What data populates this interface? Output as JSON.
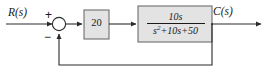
{
  "diagram": {
    "name": "closed-loop-feedback-control-block-diagram",
    "type": "control-system-block-diagram",
    "signals": {
      "input_label": "R(s)",
      "output_label": "C(s)"
    },
    "summing_junction": {
      "name": "summing-junction",
      "input_sign": "+",
      "feedback_sign": "−"
    },
    "blocks": [
      {
        "name": "gain-block",
        "label": "20",
        "kind": "gain"
      },
      {
        "name": "transfer-function-block",
        "kind": "transfer-function",
        "numerator": "10s",
        "denominator_base": "s",
        "denominator_exponent": "2",
        "denominator_rest": "+10s+50",
        "expression": "10s/(s^2+10s+50)"
      }
    ],
    "feedback": {
      "name": "unity-feedback-path",
      "label": "",
      "unity": true
    },
    "colors": {
      "block_fill": "#e3e3e3",
      "block_border": "#6e6e6e",
      "line": "#2b2b2b",
      "text": "#1a1a1a",
      "background": "#ffffff"
    }
  }
}
